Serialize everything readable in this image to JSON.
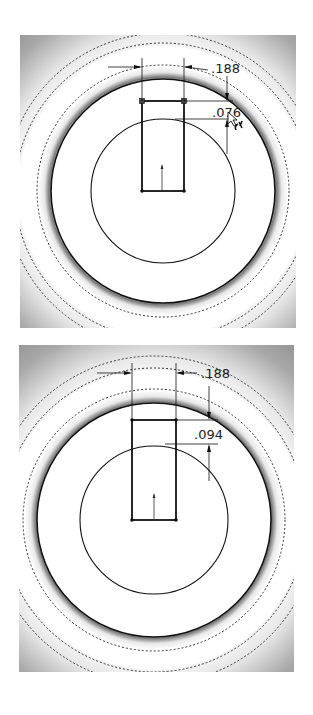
{
  "figures": [
    {
      "id": "top",
      "dimensions": {
        "width_label": ".188",
        "depth_label": ".076"
      },
      "cursor": "dimension-cursor-icon"
    },
    {
      "id": "bottom",
      "dimensions": {
        "width_label": ".188",
        "depth_label": ".094"
      }
    }
  ],
  "colors": {
    "background": "#ffffff",
    "shade": "#9a9a9a",
    "line": "#111111"
  }
}
